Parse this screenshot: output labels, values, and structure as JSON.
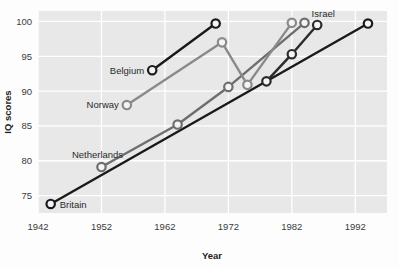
{
  "chart_data": {
    "type": "line",
    "title": "",
    "xlabel": "Year",
    "ylabel": "IQ scores",
    "xlim": [
      1942,
      1997
    ],
    "ylim": [
      72.5,
      101.5
    ],
    "xticks": [
      1942,
      1952,
      1962,
      1972,
      1982,
      1992
    ],
    "yticks": [
      75,
      80,
      85,
      90,
      95,
      100
    ],
    "grid": true,
    "legend_position": "inline-labels",
    "plot_background": "#e8e8e8",
    "gridline_color": "#ffffff",
    "marker": "open-circle",
    "series": [
      {
        "name": "Britain",
        "color": "#1a1a1a",
        "label_position": "right-of-first-point",
        "x": [
          1944,
          1994
        ],
        "y": [
          73.8,
          99.7
        ]
      },
      {
        "name": "Netherlands",
        "color": "#6e6e6e",
        "label_position": "above-first-point",
        "x": [
          1952,
          1964,
          1972,
          1984
        ],
        "y": [
          79.1,
          85.2,
          90.6,
          99.8
        ]
      },
      {
        "name": "Norway",
        "color": "#8a8a8a",
        "label_position": "left-of-first-point",
        "x": [
          1956,
          1971,
          1975,
          1982
        ],
        "y": [
          88.0,
          97.0,
          90.9,
          99.8
        ]
      },
      {
        "name": "Belgium",
        "color": "#1a1a1a",
        "label_position": "left-of-first-point",
        "x": [
          1960,
          1970
        ],
        "y": [
          93.0,
          99.7
        ]
      },
      {
        "name": "Israel",
        "color": "#2b2b2b",
        "label_position": "above-last-point",
        "x": [
          1978,
          1982,
          1986
        ],
        "y": [
          91.4,
          95.3,
          99.5
        ]
      }
    ]
  }
}
